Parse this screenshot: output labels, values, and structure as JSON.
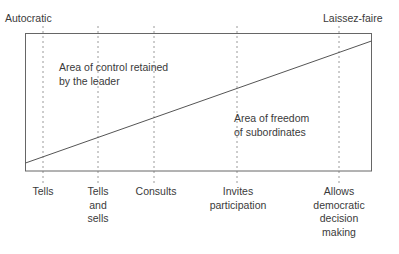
{
  "diagram": {
    "title_left": "Autocratic",
    "title_right": "Laissez-faire",
    "region_upper": [
      "Area of control retained",
      "by the leader"
    ],
    "region_lower": [
      "Area of freedom",
      "of subordinates"
    ],
    "behaviors": [
      {
        "lines": [
          "Tells"
        ],
        "x": 43
      },
      {
        "lines": [
          "Tells",
          "and",
          "sells"
        ],
        "x": 98
      },
      {
        "lines": [
          "Consults"
        ],
        "x": 154
      },
      {
        "lines": [
          "Invites",
          "participation"
        ],
        "x": 237
      },
      {
        "lines": [
          "Allows",
          "democratic",
          "decision",
          "making"
        ],
        "x": 339
      }
    ],
    "colors": {
      "line": "#555555",
      "dotted": "#999999",
      "text": "#3a3a3a"
    }
  }
}
